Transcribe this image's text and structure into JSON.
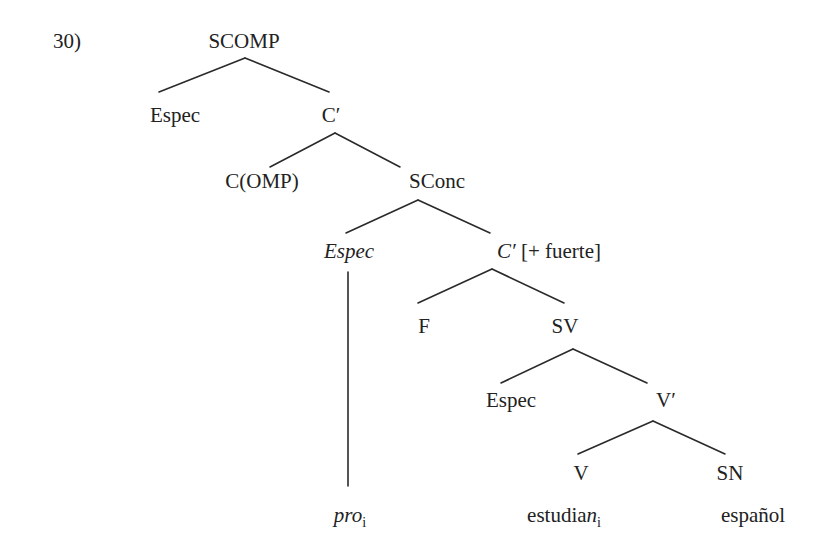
{
  "example_number": "30)",
  "tree": {
    "nodes": [
      {
        "id": "scomp",
        "parts": [
          {
            "t": "SCOMP"
          }
        ],
        "x": 244,
        "y": 48
      },
      {
        "id": "espec-1",
        "parts": [
          {
            "t": "Espec"
          }
        ],
        "x": 175,
        "y": 122
      },
      {
        "id": "c-bar",
        "parts": [
          {
            "t": "C′"
          }
        ],
        "x": 331,
        "y": 122
      },
      {
        "id": "comp",
        "parts": [
          {
            "t": "C(OMP)"
          }
        ],
        "x": 262,
        "y": 188
      },
      {
        "id": "sconc",
        "parts": [
          {
            "t": "SConc"
          }
        ],
        "x": 437,
        "y": 188
      },
      {
        "id": "espec-2",
        "parts": [
          {
            "t": "Espec",
            "i": true
          }
        ],
        "x": 349,
        "y": 258
      },
      {
        "id": "c-bar-fuerte",
        "parts": [
          {
            "t": "C′",
            "i": true
          },
          {
            "t": " [+ fuerte]"
          }
        ],
        "x": 549,
        "y": 258
      },
      {
        "id": "f",
        "parts": [
          {
            "t": "F"
          }
        ],
        "x": 424,
        "y": 333
      },
      {
        "id": "sv",
        "parts": [
          {
            "t": "SV"
          }
        ],
        "x": 565,
        "y": 333
      },
      {
        "id": "espec-3",
        "parts": [
          {
            "t": "Espec"
          }
        ],
        "x": 511,
        "y": 407
      },
      {
        "id": "v-bar",
        "parts": [
          {
            "t": "V′"
          }
        ],
        "x": 666,
        "y": 407
      },
      {
        "id": "v",
        "parts": [
          {
            "t": "V"
          }
        ],
        "x": 581,
        "y": 480
      },
      {
        "id": "sn",
        "parts": [
          {
            "t": "SN"
          }
        ],
        "x": 730,
        "y": 480
      },
      {
        "id": "pro",
        "parts": [
          {
            "t": "pro",
            "i": true
          },
          {
            "t": "i",
            "sub": true
          }
        ],
        "x": 350,
        "y": 522
      },
      {
        "id": "estudian",
        "parts": [
          {
            "t": "estudia"
          },
          {
            "t": "n",
            "i": true
          },
          {
            "t": "i",
            "sub": true
          }
        ],
        "x": 564,
        "y": 522
      },
      {
        "id": "espanol",
        "parts": [
          {
            "t": "español"
          }
        ],
        "x": 753,
        "y": 522
      }
    ],
    "edges": [
      {
        "from": "scomp",
        "to": "espec-1",
        "x1": 245,
        "y1": 58,
        "x2": 159,
        "y2": 92
      },
      {
        "from": "scomp",
        "to": "c-bar",
        "x1": 245,
        "y1": 58,
        "x2": 329,
        "y2": 92
      },
      {
        "from": "c-bar",
        "to": "comp",
        "x1": 335,
        "y1": 133,
        "x2": 270,
        "y2": 167
      },
      {
        "from": "c-bar",
        "to": "sconc",
        "x1": 335,
        "y1": 133,
        "x2": 400,
        "y2": 167
      },
      {
        "from": "sconc",
        "to": "espec-2",
        "x1": 418,
        "y1": 200,
        "x2": 346,
        "y2": 233
      },
      {
        "from": "sconc",
        "to": "c-bar-fuerte",
        "x1": 418,
        "y1": 200,
        "x2": 490,
        "y2": 233
      },
      {
        "from": "espec-2",
        "to": "pro",
        "x1": 348,
        "y1": 272,
        "x2": 348,
        "y2": 486
      },
      {
        "from": "c-bar-fuerte",
        "to": "f",
        "x1": 492,
        "y1": 269,
        "x2": 418,
        "y2": 303
      },
      {
        "from": "c-bar-fuerte",
        "to": "sv",
        "x1": 492,
        "y1": 269,
        "x2": 564,
        "y2": 303
      },
      {
        "from": "sv",
        "to": "espec-3",
        "x1": 573,
        "y1": 349,
        "x2": 501,
        "y2": 383
      },
      {
        "from": "sv",
        "to": "v-bar",
        "x1": 573,
        "y1": 349,
        "x2": 647,
        "y2": 383
      },
      {
        "from": "v-bar",
        "to": "v",
        "x1": 653,
        "y1": 421,
        "x2": 578,
        "y2": 454
      },
      {
        "from": "v-bar",
        "to": "sn",
        "x1": 653,
        "y1": 421,
        "x2": 725,
        "y2": 454
      }
    ]
  },
  "colors": {
    "text": "#222222",
    "line": "#2a2a2a",
    "background": "#ffffff"
  }
}
